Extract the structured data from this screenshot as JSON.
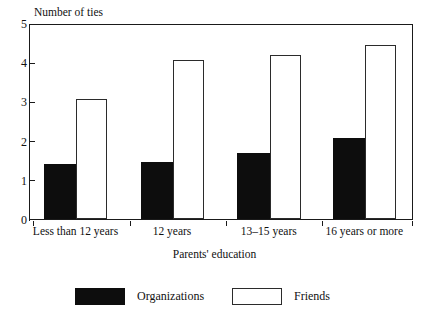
{
  "chart_data": {
    "type": "bar",
    "title": "",
    "ylabel": "Number of ties",
    "xlabel": "Parents' education",
    "categories": [
      "Less than 12 years",
      "12 years",
      "13–15 years",
      "16 years or more"
    ],
    "series": [
      {
        "name": "Organizations",
        "color": "#0d0d0d",
        "values": [
          1.4,
          1.46,
          1.68,
          2.06
        ]
      },
      {
        "name": "Friends",
        "color": "#ffffff",
        "values": [
          3.05,
          4.06,
          4.19,
          4.45
        ]
      }
    ],
    "ylim": [
      0,
      5
    ],
    "yticks": [
      "0",
      "1",
      "2",
      "3",
      "4",
      "5"
    ],
    "grid": false,
    "legend_position": "bottom"
  },
  "legend": {
    "items": [
      {
        "label": "Organizations",
        "swatch": "filled-black"
      },
      {
        "label": "Friends",
        "swatch": "outlined-white"
      }
    ]
  },
  "colors": {
    "axis": "#1a1a1a",
    "bar_organizations": "#0d0d0d",
    "bar_friends": "#ffffff",
    "bar_friends_border": "#2b2b2b",
    "background": "#ffffff"
  }
}
